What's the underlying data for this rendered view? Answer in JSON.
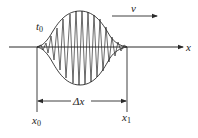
{
  "diagram": {
    "labels": {
      "time": "t",
      "time_sub": "0",
      "velocity": "v",
      "axis": "x",
      "delta": "Δx",
      "start": "x",
      "start_sub": "0",
      "end": "x",
      "end_sub": "1"
    },
    "colors": {
      "stroke": "#2a2a2a",
      "background": "#ffffff"
    }
  }
}
